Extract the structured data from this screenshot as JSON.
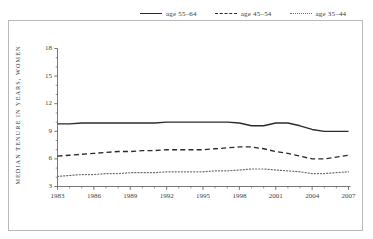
{
  "figure": {
    "background": "#ffffff",
    "frame_color": "#b9b9b9"
  },
  "legend": {
    "position": "top-center",
    "entries": [
      {
        "label": "age 55–64",
        "style": "solid",
        "color": "#2b2b2b"
      },
      {
        "label": "age 45–54",
        "style": "dashed",
        "color": "#2b2b2b"
      },
      {
        "label": "age 35–44",
        "style": "dotted",
        "color": "#6d6d6d"
      }
    ]
  },
  "axes": {
    "ylabel": "MEDIAN TENURE IN YEARS, WOMEN",
    "ytick_labels": [
      "18",
      "15",
      "12",
      "9",
      "6",
      "3"
    ],
    "xtick_labels": [
      "1983",
      "1986",
      "1989",
      "1992",
      "1995",
      "1998",
      "2001",
      "2004",
      "2007"
    ]
  },
  "chart_data": {
    "type": "line",
    "title": "",
    "xlabel": "",
    "ylabel": "MEDIAN TENURE IN YEARS, WOMEN",
    "xlim": [
      1983,
      2008
    ],
    "ylim": [
      3,
      18
    ],
    "yticks": [
      3,
      6,
      9,
      12,
      15,
      18
    ],
    "xticks": [
      1983,
      1986,
      1989,
      1992,
      1995,
      1998,
      2001,
      2004,
      2007
    ],
    "xtick_minor_step": 1,
    "grid": false,
    "legend_position": "top-center",
    "x": [
      1983,
      1984,
      1985,
      1986,
      1987,
      1988,
      1989,
      1990,
      1991,
      1992,
      1993,
      1994,
      1995,
      1996,
      1997,
      1998,
      1999,
      2000,
      2001,
      2002,
      2003,
      2004,
      2005,
      2006,
      2007
    ],
    "series": [
      {
        "name": "age 55–64",
        "style": "solid",
        "color": "#2b2b2b",
        "values": [
          9.8,
          9.8,
          9.9,
          9.9,
          9.9,
          9.9,
          9.9,
          9.9,
          9.9,
          10.0,
          10.0,
          10.0,
          10.0,
          10.0,
          10.0,
          9.9,
          9.6,
          9.6,
          9.9,
          9.9,
          9.6,
          9.2,
          9.0,
          9.0,
          9.0
        ]
      },
      {
        "name": "age 45–54",
        "style": "dashed",
        "color": "#2b2b2b",
        "values": [
          6.3,
          6.4,
          6.5,
          6.6,
          6.7,
          6.8,
          6.8,
          6.9,
          6.9,
          7.0,
          7.0,
          7.0,
          7.0,
          7.1,
          7.2,
          7.3,
          7.3,
          7.1,
          6.8,
          6.6,
          6.3,
          6.0,
          6.0,
          6.2,
          6.4
        ]
      },
      {
        "name": "age 35–44",
        "style": "dotted",
        "color": "#6d6d6d",
        "values": [
          4.1,
          4.2,
          4.3,
          4.3,
          4.4,
          4.4,
          4.5,
          4.5,
          4.5,
          4.6,
          4.6,
          4.6,
          4.6,
          4.7,
          4.7,
          4.8,
          4.9,
          4.9,
          4.8,
          4.7,
          4.6,
          4.4,
          4.4,
          4.5,
          4.6
        ]
      }
    ]
  }
}
